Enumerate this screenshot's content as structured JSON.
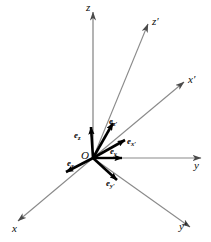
{
  "figure": {
    "background_color": "#ffffff",
    "axis_color": "#8a8a8a",
    "vector_color": "#000000",
    "origin": {
      "label": "O",
      "x": 93,
      "y": 158
    }
  },
  "axes": [
    {
      "name": "z",
      "label": "z",
      "end_x": 93,
      "end_y": 12,
      "label_x": 86,
      "label_y": 2
    },
    {
      "name": "y",
      "label": "y",
      "end_x": 201,
      "end_y": 158,
      "label_x": 194,
      "label_y": 160
    },
    {
      "name": "x",
      "label": "x",
      "end_x": 18,
      "end_y": 221,
      "label_x": 12,
      "label_y": 223
    },
    {
      "name": "z-prime",
      "label": "z′",
      "end_x": 148,
      "end_y": 24,
      "label_x": 152,
      "label_y": 17
    },
    {
      "name": "x-prime",
      "label": "x′",
      "end_x": 184,
      "end_y": 82,
      "label_x": 188,
      "label_y": 75
    },
    {
      "name": "y-prime",
      "label": "y′",
      "end_x": 190,
      "end_y": 227,
      "label_x": 180,
      "label_y": 222
    }
  ],
  "unit_vectors": [
    {
      "name": "e-z",
      "base": "e",
      "sub": "z",
      "tip_x": 91,
      "tip_y": 127,
      "label_x": 75,
      "label_y": 132
    },
    {
      "name": "e-z-prime",
      "base": "e",
      "sub": "z′",
      "tip_x": 113,
      "tip_y": 123,
      "label_x": 110,
      "label_y": 118
    },
    {
      "name": "e-x-prime",
      "base": "e",
      "sub": "x′",
      "tip_x": 125,
      "tip_y": 140,
      "label_x": 126,
      "label_y": 139
    },
    {
      "name": "e-y",
      "base": "e",
      "sub": "y",
      "tip_x": 122,
      "tip_y": 158,
      "label_x": 110,
      "label_y": 149
    },
    {
      "name": "e-x",
      "base": "e",
      "sub": "x",
      "tip_x": 66,
      "tip_y": 172,
      "label_x": 68,
      "label_y": 160
    },
    {
      "name": "e-y-prime",
      "base": "e",
      "sub": "y′",
      "tip_x": 117,
      "tip_y": 180,
      "label_x": 108,
      "label_y": 180
    }
  ]
}
